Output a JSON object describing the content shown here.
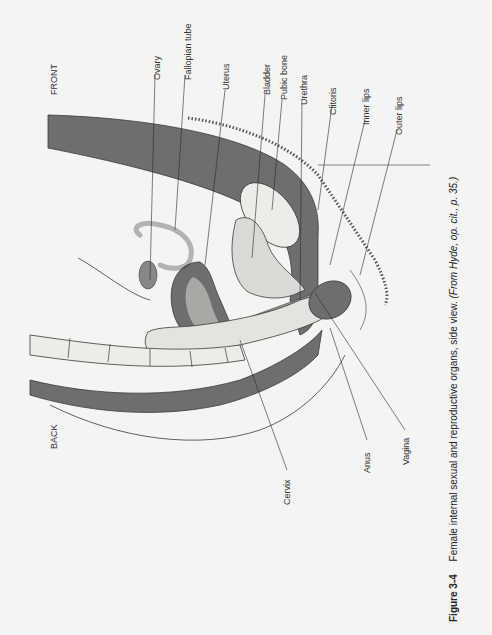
{
  "figure": {
    "orientation_labels": {
      "front": "FRONT",
      "back": "BACK"
    },
    "labels": [
      {
        "id": "ovary",
        "text": "Ovary"
      },
      {
        "id": "fallopian-tube",
        "text": "Fallopian tube"
      },
      {
        "id": "uterus",
        "text": "Uterus"
      },
      {
        "id": "bladder",
        "text": "Bladder"
      },
      {
        "id": "pubic-bone",
        "text": "Pubic bone"
      },
      {
        "id": "urethra",
        "text": "Urethra"
      },
      {
        "id": "clitoris",
        "text": "Clitoris"
      },
      {
        "id": "inner-lips",
        "text": "Inner lips"
      },
      {
        "id": "outer-lips",
        "text": "Outer lips"
      },
      {
        "id": "cervix",
        "text": "Cervix"
      },
      {
        "id": "anus",
        "text": "Anus"
      },
      {
        "id": "vagina",
        "text": "Vagina"
      }
    ],
    "caption": {
      "number": "Figure 3-4",
      "text": "Female internal sexual and reproductive organs, side view.",
      "source": "(From Hyde, op. cit., p. 35.)"
    },
    "colors": {
      "tissue_dark": "#6e6e6e",
      "tissue_light": "#d9d9d6",
      "outline": "#3a3a3a",
      "paper": "#f4f4f2"
    }
  }
}
